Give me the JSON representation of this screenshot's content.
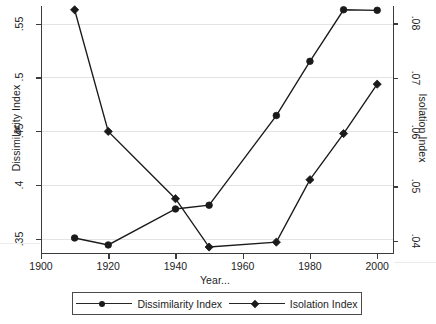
{
  "chart_data": {
    "type": "line",
    "title": "",
    "xlabel": "Year...",
    "x": [
      1910,
      1920,
      1940,
      1950,
      1970,
      1980,
      1990,
      2000
    ],
    "xlim": [
      1900,
      2005
    ],
    "xticks": [
      1900,
      1920,
      1940,
      1960,
      1980,
      2000
    ],
    "xticklabels": [
      "1900",
      "1920",
      "1940",
      "1960",
      "1980",
      "2000"
    ],
    "grid": true,
    "legend_position": "below-axis",
    "axes": [
      {
        "side": "left",
        "label": "Dissimilarity Index",
        "ylim": [
          0.3365,
          0.5665
        ],
        "yticks": [
          0.35,
          0.4,
          0.45,
          0.5,
          0.55
        ],
        "yticklabels": [
          ".35",
          ".4",
          ".45",
          ".5",
          ".55"
        ]
      },
      {
        "side": "right",
        "label": "Isolation Index",
        "ylim": [
          0.0377,
          0.0832
        ],
        "yticks": [
          0.04,
          0.05,
          0.06,
          0.07,
          0.08
        ],
        "yticklabels": [
          ".04",
          ".05",
          ".06",
          ".07",
          ".08"
        ]
      }
    ],
    "series": [
      {
        "name": "Dissimilarity Index",
        "axis": "left",
        "marker": "circle",
        "color": "#1a1a1a",
        "x": [
          1910,
          1920,
          1940,
          1950,
          1970,
          1980,
          1990,
          2000
        ],
        "values": [
          0.3505,
          0.344,
          0.3775,
          0.381,
          0.4645,
          0.515,
          0.563,
          0.5625
        ]
      },
      {
        "name": "Isolation Index",
        "axis": "right",
        "marker": "diamond",
        "color": "#1a1a1a",
        "x": [
          1910,
          1920,
          1940,
          1950,
          1970,
          1980,
          1990,
          2000
        ],
        "values": [
          0.0825,
          0.0601,
          0.0477,
          0.0388,
          0.0397,
          0.0512,
          0.0597,
          0.0688
        ]
      }
    ]
  },
  "legend": {
    "entries": [
      {
        "label": "Dissimilarity Index",
        "marker": "circle"
      },
      {
        "label": "Isolation Index",
        "marker": "diamond"
      }
    ]
  }
}
